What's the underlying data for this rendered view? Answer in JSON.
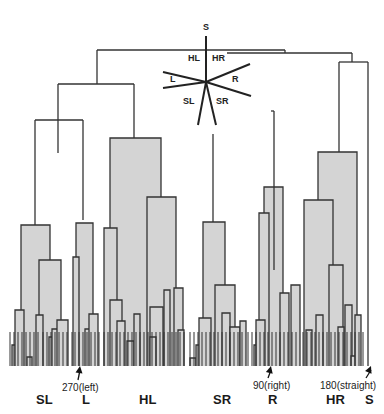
{
  "figure": {
    "background": "#ffffff",
    "line_color": "#333333",
    "fill_color": "#d4d4d4"
  },
  "compass": {
    "center": [
      206,
      82
    ],
    "rays": [
      {
        "label": "S",
        "end": [
          206,
          36
        ]
      },
      {
        "label": "HR",
        "end": [
          250,
          64
        ]
      },
      {
        "label": "R",
        "end": [
          251,
          96
        ]
      },
      {
        "label": "SR",
        "end": [
          216,
          125
        ]
      },
      {
        "label": "SL",
        "end": [
          198,
          125
        ]
      },
      {
        "label": "L_upper",
        "end": [
          163,
          72
        ]
      },
      {
        "label": "L_lower",
        "end": [
          163,
          88
        ]
      }
    ],
    "labels": [
      {
        "text": "S",
        "x": 203,
        "y": 22
      },
      {
        "text": "HL",
        "x": 188,
        "y": 53
      },
      {
        "text": "HR",
        "x": 212,
        "y": 53
      },
      {
        "text": "L",
        "x": 170,
        "y": 74
      },
      {
        "text": "R",
        "x": 232,
        "y": 74
      },
      {
        "text": "SL",
        "x": 183,
        "y": 96
      },
      {
        "text": "SR",
        "x": 216,
        "y": 96
      }
    ]
  },
  "annotations": [
    {
      "text": "270(left)",
      "x": 62,
      "y": 382,
      "arrow_from": [
        78,
        380
      ],
      "arrow_to": [
        80,
        366
      ]
    },
    {
      "text": "90(right)",
      "x": 253,
      "y": 380,
      "arrow_from": [
        268,
        378
      ],
      "arrow_to": [
        271,
        366
      ]
    },
    {
      "text": "180(straight)",
      "x": 320,
      "y": 380,
      "arrow_from": [
        366,
        378
      ],
      "arrow_to": [
        371,
        366
      ]
    }
  ],
  "group_labels": [
    {
      "text": "SL",
      "x": 36,
      "y": 392
    },
    {
      "text": "L",
      "x": 82,
      "y": 392
    },
    {
      "text": "HL",
      "x": 139,
      "y": 392
    },
    {
      "text": "SR",
      "x": 213,
      "y": 392
    },
    {
      "text": "R",
      "x": 268,
      "y": 392
    },
    {
      "text": "HR",
      "x": 326,
      "y": 392
    },
    {
      "text": "S",
      "x": 365,
      "y": 392
    }
  ],
  "dendrogram": {
    "baseline": 366,
    "links": [
      [
        97,
        50,
        285,
        50,
        "top-root"
      ],
      [
        97,
        50,
        97,
        84,
        ""
      ],
      [
        285,
        50,
        285,
        53,
        ""
      ],
      [
        58,
        84,
        134,
        84,
        "left-clade"
      ],
      [
        58,
        84,
        58,
        153,
        ""
      ],
      [
        134,
        84,
        134,
        138,
        ""
      ],
      [
        35,
        120,
        83,
        120,
        ""
      ],
      [
        35,
        120,
        35,
        225,
        ""
      ],
      [
        83,
        120,
        83,
        220,
        ""
      ],
      [
        227,
        53,
        352,
        53,
        "right-clade"
      ],
      [
        352,
        53,
        352,
        62,
        ""
      ],
      [
        339,
        62,
        368,
        62,
        ""
      ],
      [
        339,
        62,
        339,
        152,
        ""
      ],
      [
        368,
        62,
        368,
        366,
        ""
      ],
      [
        271,
        111,
        274,
        111,
        ""
      ],
      [
        274,
        111,
        274,
        270,
        ""
      ],
      [
        213,
        134,
        213,
        222,
        ""
      ]
    ],
    "boxes": [
      {
        "x": 110,
        "y": 138,
        "w": 51,
        "h": 228,
        "name": "HL-main"
      },
      {
        "x": 21,
        "y": 225,
        "w": 29,
        "h": 141,
        "name": "SL-main"
      },
      {
        "x": 39,
        "y": 260,
        "w": 22,
        "h": 106,
        "name": "SL-sub"
      },
      {
        "x": 76,
        "y": 223,
        "w": 17,
        "h": 143,
        "name": "L-main"
      },
      {
        "x": 73,
        "y": 257,
        "w": 6,
        "h": 109,
        "name": "L-sub"
      },
      {
        "x": 147,
        "y": 197,
        "w": 29,
        "h": 169,
        "name": "HL-right"
      },
      {
        "x": 104,
        "y": 228,
        "w": 13,
        "h": 138,
        "name": "HL-left"
      },
      {
        "x": 203,
        "y": 222,
        "w": 22,
        "h": 144,
        "name": "SR-main"
      },
      {
        "x": 215,
        "y": 285,
        "w": 20,
        "h": 81,
        "name": "SR-sub"
      },
      {
        "x": 264,
        "y": 187,
        "w": 19,
        "h": 179,
        "name": "R-main"
      },
      {
        "x": 259,
        "y": 213,
        "w": 10,
        "h": 153,
        "name": "R-sub"
      },
      {
        "x": 318,
        "y": 152,
        "w": 39,
        "h": 214,
        "name": "HR-main"
      },
      {
        "x": 304,
        "y": 200,
        "w": 29,
        "h": 166,
        "name": "HR-left"
      },
      {
        "x": 329,
        "y": 265,
        "w": 14,
        "h": 101,
        "name": "HR-sub"
      }
    ],
    "leaf_clusters": [
      {
        "x": 12,
        "y": 345,
        "w": 7,
        "h": 21
      },
      {
        "x": 15,
        "y": 310,
        "w": 9,
        "h": 56
      },
      {
        "x": 27,
        "y": 357,
        "w": 5,
        "h": 9
      },
      {
        "x": 36,
        "y": 315,
        "w": 7,
        "h": 51
      },
      {
        "x": 49,
        "y": 337,
        "w": 6,
        "h": 29
      },
      {
        "x": 52,
        "y": 329,
        "w": 8,
        "h": 37
      },
      {
        "x": 57,
        "y": 320,
        "w": 11,
        "h": 46
      },
      {
        "x": 85,
        "y": 329,
        "w": 6,
        "h": 37
      },
      {
        "x": 89,
        "y": 314,
        "w": 9,
        "h": 52
      },
      {
        "x": 110,
        "y": 300,
        "w": 12,
        "h": 66
      },
      {
        "x": 117,
        "y": 321,
        "w": 8,
        "h": 45
      },
      {
        "x": 127,
        "y": 341,
        "w": 7,
        "h": 25
      },
      {
        "x": 134,
        "y": 314,
        "w": 6,
        "h": 52
      },
      {
        "x": 150,
        "y": 307,
        "w": 13,
        "h": 59
      },
      {
        "x": 150,
        "y": 337,
        "w": 6,
        "h": 29
      },
      {
        "x": 164,
        "y": 290,
        "w": 6,
        "h": 76
      },
      {
        "x": 174,
        "y": 288,
        "w": 9,
        "h": 78
      },
      {
        "x": 178,
        "y": 330,
        "w": 6,
        "h": 36
      },
      {
        "x": 190,
        "y": 358,
        "w": 6,
        "h": 8
      },
      {
        "x": 196,
        "y": 345,
        "w": 10,
        "h": 21
      },
      {
        "x": 199,
        "y": 318,
        "w": 12,
        "h": 48
      },
      {
        "x": 222,
        "y": 313,
        "w": 8,
        "h": 53
      },
      {
        "x": 230,
        "y": 327,
        "w": 10,
        "h": 39
      },
      {
        "x": 240,
        "y": 321,
        "w": 6,
        "h": 45
      },
      {
        "x": 254,
        "y": 345,
        "w": 6,
        "h": 21
      },
      {
        "x": 256,
        "y": 320,
        "w": 9,
        "h": 46
      },
      {
        "x": 280,
        "y": 293,
        "w": 9,
        "h": 73
      },
      {
        "x": 291,
        "y": 285,
        "w": 9,
        "h": 81
      },
      {
        "x": 306,
        "y": 330,
        "w": 6,
        "h": 36
      },
      {
        "x": 316,
        "y": 315,
        "w": 7,
        "h": 51
      },
      {
        "x": 338,
        "y": 327,
        "w": 6,
        "h": 39
      },
      {
        "x": 345,
        "y": 305,
        "w": 7,
        "h": 61
      },
      {
        "x": 351,
        "y": 356,
        "w": 6,
        "h": 10
      },
      {
        "x": 355,
        "y": 315,
        "w": 6,
        "h": 51
      }
    ],
    "leaf_lines": [
      10,
      14,
      18,
      22,
      26,
      30,
      34,
      38,
      43,
      47,
      51,
      55,
      59,
      63,
      67,
      72,
      75,
      79,
      83,
      87,
      91,
      95,
      99,
      104,
      108,
      112,
      116,
      120,
      124,
      128,
      132,
      136,
      140,
      144,
      148,
      152,
      156,
      160,
      164,
      168,
      172,
      176,
      180,
      184,
      190,
      194,
      198,
      202,
      206,
      210,
      214,
      218,
      222,
      226,
      230,
      234,
      238,
      242,
      248,
      252,
      256,
      260,
      264,
      268,
      272,
      276,
      280,
      284,
      288,
      292,
      296,
      303,
      307,
      311,
      315,
      319,
      323,
      327,
      331,
      335,
      339,
      343,
      347,
      351,
      355,
      359,
      363
    ]
  }
}
